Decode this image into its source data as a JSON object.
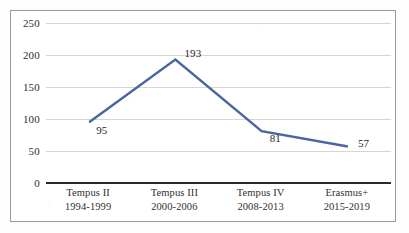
{
  "chart_data": {
    "type": "line",
    "title": "",
    "subtitle": "",
    "xlabel": "",
    "ylabel": "",
    "categories": [
      "Tempus II\n1994-1999",
      "Tempus III\n2000-2006",
      "Tempus IV\n2008-2013",
      "Erasmus+\n2015-2019"
    ],
    "category_lines": [
      [
        "Tempus II",
        "1994-1999"
      ],
      [
        "Tempus III",
        "2000-2006"
      ],
      [
        "Tempus IV",
        "2008-2013"
      ],
      [
        "Erasmus+",
        "2015-2019"
      ]
    ],
    "values": [
      95,
      193,
      81,
      57
    ],
    "data_labels": [
      "95",
      "193",
      "81",
      "57"
    ],
    "ylim": [
      0,
      250
    ],
    "ytick_values": [
      0,
      50,
      100,
      150,
      200,
      250
    ],
    "ytick_labels": [
      "0",
      "50",
      "100",
      "150",
      "200",
      "250"
    ],
    "grid": true,
    "grid_axis": "y",
    "legend": false,
    "legend_position": "none",
    "series": [
      {
        "name": "",
        "values": [
          95,
          193,
          81,
          57
        ],
        "color": "#4a66a0"
      }
    ],
    "colors": {
      "line": "#4a66a0",
      "gridline": "#d6d6d6",
      "axis": "#2a2a2a",
      "frame_border": "#9a9a9a",
      "plot_background": "#ffffff",
      "tick_label": "#2f2f2f",
      "data_label": "#262626"
    }
  }
}
